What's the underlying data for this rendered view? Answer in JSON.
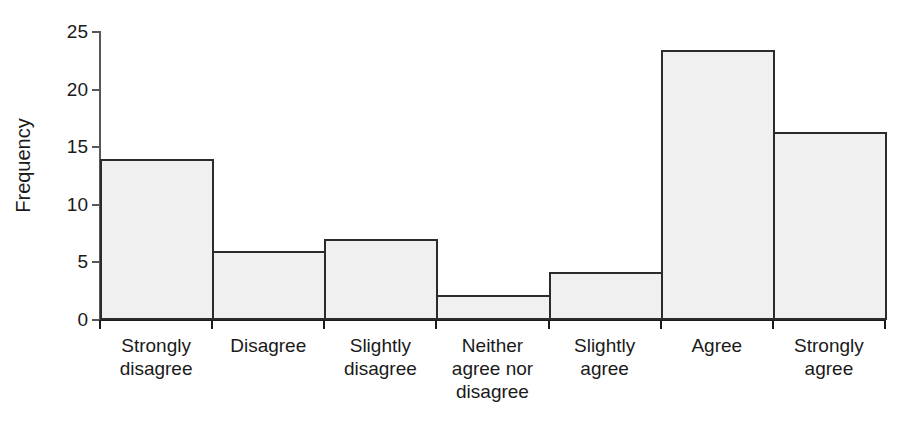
{
  "chart_data": {
    "type": "bar",
    "title": "",
    "xlabel": "",
    "ylabel": "Frequency",
    "ylim": [
      0,
      25
    ],
    "yticks": [
      0,
      5,
      10,
      15,
      20,
      25
    ],
    "ytick_labels": [
      "0",
      "5",
      "10",
      "15",
      "20",
      "25"
    ],
    "grid": false,
    "legend": "none",
    "bar_style": {
      "fill": "#f0f0f0",
      "edge": "#2b2b2b",
      "gap": 0
    },
    "categories": [
      "Strongly disagree",
      "Disagree",
      "Slightly disagree",
      "Neither agree nor disagree",
      "Slightly agree",
      "Agree",
      "Strongly agree"
    ],
    "category_lines": [
      [
        "Strongly",
        "disagree"
      ],
      [
        "Disagree"
      ],
      [
        "Slightly",
        "disagree"
      ],
      [
        "Neither",
        "agree nor",
        "disagree"
      ],
      [
        "Slightly",
        "agree"
      ],
      [
        "Agree"
      ],
      [
        "Strongly",
        "agree"
      ]
    ],
    "values": [
      14,
      6,
      7,
      2.2,
      4.2,
      23.4,
      16.3
    ]
  }
}
